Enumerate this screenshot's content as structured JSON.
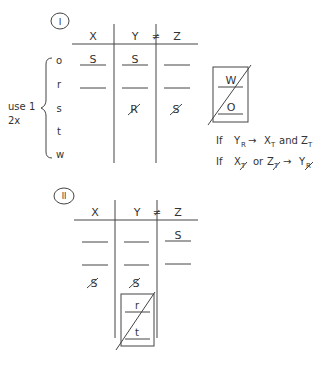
{
  "scenario_1": {
    "number": "I",
    "headers": [
      "X",
      "Y",
      "Z"
    ],
    "not_equal_symbol": "≠",
    "row_labels": [
      "o",
      "r",
      "s",
      "t",
      "w"
    ],
    "brace_note": [
      "use 1",
      "2x"
    ],
    "cells": {
      "o": [
        "S",
        "S",
        ""
      ],
      "r": [
        "",
        "",
        ""
      ],
      "s": [
        "",
        "R (crossed out)",
        "S (crossed out)"
      ]
    },
    "side_box": [
      "W",
      "O"
    ],
    "rules": [
      "If Y_R → X_T and Z_T",
      "If X_T̸ or Z_T̸ → Y_R̸"
    ]
  },
  "scenario_2": {
    "number": "II",
    "headers": [
      "X",
      "Y",
      "Z"
    ],
    "not_equal_symbol": "≠",
    "cells": {
      "row1": [
        "",
        "",
        "S"
      ],
      "row2": [
        "",
        "",
        ""
      ],
      "row3": [
        "S (crossed out)",
        "S (crossed out)",
        ""
      ]
    },
    "box_in_y": [
      "r",
      "t"
    ]
  },
  "labels": {
    "s1_number": "I",
    "s2_number": "II",
    "x": "X",
    "y": "Y",
    "z": "Z",
    "neq": "≠",
    "o": "o",
    "r": "r",
    "s": "s",
    "t": "t",
    "w": "w",
    "use1": "use 1",
    "twox": "2x",
    "S": "S",
    "R": "R",
    "W": "W",
    "O": "O",
    "if": "If",
    "and": "and",
    "or": "or",
    "arrow": "→"
  }
}
